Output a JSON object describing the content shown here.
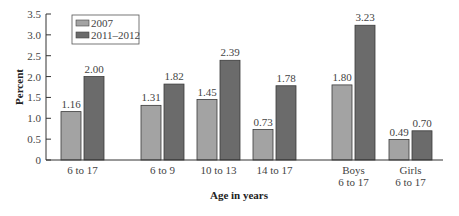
{
  "chart_data": {
    "type": "bar",
    "title": "",
    "xlabel": "Age in years",
    "ylabel": "Percent",
    "ylim": [
      0,
      3.5
    ],
    "yticks": [
      "0",
      "0.5",
      "1.0",
      "1.5",
      "2.0",
      "2.5",
      "3.0",
      "3.5"
    ],
    "grid": false,
    "legend_position": "top-left",
    "categories": [
      "6 to 17",
      "6 to 9",
      "10 to 13",
      "14 to 17",
      "Boys\n6 to 17",
      "Girls\n6 to 17"
    ],
    "series": [
      {
        "name": "2007",
        "color": "#a3a3a3",
        "values": [
          1.16,
          1.31,
          1.45,
          0.73,
          1.8,
          0.49
        ],
        "labels": [
          "1.16",
          "1.31",
          "1.45",
          "0.73",
          "1.80",
          "0.49"
        ]
      },
      {
        "name": "2011–2012",
        "color": "#6b6b6b",
        "values": [
          2.0,
          1.82,
          2.39,
          1.78,
          3.23,
          0.7
        ],
        "labels": [
          "2.00",
          "1.82",
          "2.39",
          "1.78",
          "3.23",
          "0.70"
        ]
      }
    ]
  },
  "legend": {
    "items": [
      "2007",
      "2011–2012"
    ]
  },
  "axes": {
    "x_title": "Age in years",
    "y_title": "Percent"
  }
}
